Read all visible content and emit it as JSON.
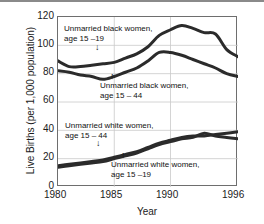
{
  "chart_data": {
    "type": "line",
    "title": "",
    "xlabel": "Year",
    "ylabel": "Live Births (per 1,000 population)",
    "xlim": [
      1980,
      1996
    ],
    "ylim": [
      0,
      120
    ],
    "yticks": [
      0,
      20,
      40,
      60,
      80,
      100,
      120
    ],
    "xticks": [
      1980,
      1985,
      1990,
      1996
    ],
    "grid": true,
    "legend_position": "inline-annotations",
    "x": [
      1980,
      1981,
      1982,
      1983,
      1984,
      1985,
      1986,
      1987,
      1988,
      1989,
      1990,
      1991,
      1992,
      1993,
      1994,
      1995,
      1996
    ],
    "series": [
      {
        "name": "Unmarried black women, age 15-19",
        "values": [
          89,
          85,
          85,
          86,
          87,
          88,
          91,
          94,
          99,
          107,
          111,
          114,
          112,
          109,
          108,
          97,
          92
        ]
      },
      {
        "name": "Unmarried black women, age 15-44",
        "values": [
          82,
          81,
          79,
          78,
          76,
          78,
          81,
          84,
          89,
          95,
          95,
          93,
          90,
          87,
          84,
          80,
          78
        ]
      },
      {
        "name": "Unmarried white women, age 15-44",
        "values": [
          15,
          16,
          17,
          18,
          19,
          21,
          23,
          25,
          28,
          31,
          33,
          35,
          36,
          36,
          37,
          38,
          39
        ]
      },
      {
        "name": "Unmarried white women, age 15-19",
        "values": [
          14,
          15,
          16,
          17,
          18,
          20,
          22,
          24,
          27,
          30,
          32,
          34,
          35,
          38,
          36,
          35,
          34
        ]
      }
    ],
    "annotations": [
      {
        "id": "black-15-19",
        "line1": "Unmarried black women,",
        "line2": "age 15 –19",
        "arrow": "↓"
      },
      {
        "id": "black-15-44",
        "line1": "Unmarried black women,",
        "line2": "age 15 – 44",
        "arrow": "↑"
      },
      {
        "id": "white-15-44",
        "line1": "Unmarried white women,",
        "line2": "age 15 – 44",
        "arrow": "↓"
      },
      {
        "id": "white-15-19",
        "line1": "Unmarried white women,",
        "line2": "age 15 –19",
        "arrow": "↑"
      }
    ],
    "colors": {
      "line": "#2b2b2b",
      "grid": "#c9c9c9",
      "frame": "#6e6e6e",
      "text": "#111111",
      "background": "#ffffff"
    }
  },
  "axis": {
    "y_title": "Live Births (per 1,000 population)",
    "x_title": "Year",
    "y_ticks": [
      "120",
      "100",
      "80",
      "60",
      "40",
      "20",
      "0"
    ],
    "x_ticks": [
      "1980",
      "1985",
      "1990",
      "1996"
    ]
  }
}
